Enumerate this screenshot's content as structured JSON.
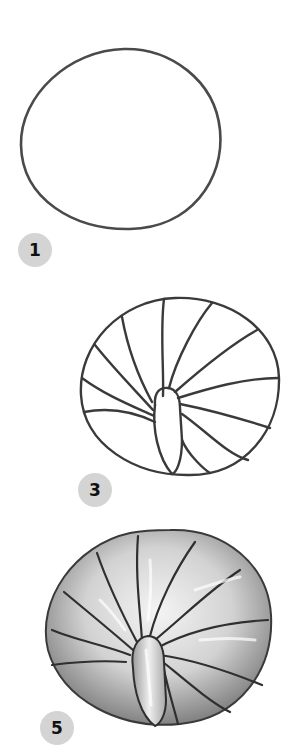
{
  "tutorial": {
    "subject": "spiral shell / pill bug drawing steps",
    "steps": [
      {
        "number": "1",
        "description": "Draw a rounded circle outline"
      },
      {
        "number": "3",
        "description": "Add central oval and curved radiating segment lines"
      },
      {
        "number": "5",
        "description": "Shade segments with pencil gradients"
      }
    ]
  },
  "colors": {
    "background": "#ffffff",
    "line": "#3a3a3a",
    "badge_fill": "#d4d4d4",
    "badge_text": "#111111",
    "shade_dark": "#8a8a8a",
    "shade_light": "#f2f2f2"
  }
}
